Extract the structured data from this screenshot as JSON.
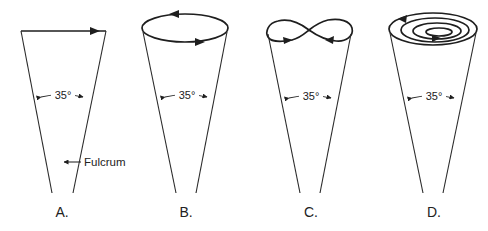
{
  "figure": {
    "panels": [
      {
        "id": "A",
        "label": "A.",
        "angle": "35°",
        "path_type": "straight-line sweep"
      },
      {
        "id": "B",
        "label": "B.",
        "angle": "35°",
        "path_type": "circular orbit"
      },
      {
        "id": "C",
        "label": "C.",
        "angle": "35°",
        "path_type": "figure-eight"
      },
      {
        "id": "D",
        "label": "D.",
        "angle": "35°",
        "path_type": "spiral"
      }
    ],
    "annotation": {
      "text": "Fulcrum",
      "points_to": "crossing point of panel A"
    },
    "colors": {
      "line": "#222222",
      "background": "#ffffff"
    }
  }
}
